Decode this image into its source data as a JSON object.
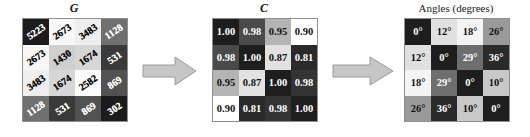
{
  "figure": {
    "background": "#ffffff",
    "arrow_fill": "#c6c6c6",
    "arrow_stroke": "#9a9a9a",
    "grid_border": "#8f8f8f"
  },
  "panels": [
    {
      "id": "g",
      "title": "G",
      "title_style": "italic-bold",
      "matrix": {
        "rows": 4,
        "cols": 4,
        "values": [
          [
            "5223",
            "2673",
            "3483",
            "1128"
          ],
          [
            "2673",
            "1430",
            "1674",
            "531"
          ],
          [
            "3483",
            "1674",
            "2582",
            "869"
          ],
          [
            "1128",
            "531",
            "869",
            "302"
          ]
        ],
        "fills": [
          [
            "#1c1c1c",
            "#f7f7f7",
            "#eeeeee",
            "#707070"
          ],
          [
            "#f7f7f7",
            "#cfcfcf",
            "#d6d6d6",
            "#3a3a3a"
          ],
          [
            "#eeeeee",
            "#d6d6d6",
            "#fbfbfb",
            "#525252"
          ],
          [
            "#707070",
            "#3a3a3a",
            "#525252",
            "#1c1c1c"
          ]
        ],
        "text_colors": [
          [
            "#ffffff",
            "#111111",
            "#111111",
            "#ffffff"
          ],
          [
            "#111111",
            "#111111",
            "#111111",
            "#ffffff"
          ],
          [
            "#111111",
            "#111111",
            "#111111",
            "#ffffff"
          ],
          [
            "#ffffff",
            "#ffffff",
            "#ffffff",
            "#ffffff"
          ]
        ]
      }
    },
    {
      "id": "c",
      "title": "C",
      "title_style": "italic-bold",
      "matrix": {
        "rows": 4,
        "cols": 4,
        "values": [
          [
            "1.00",
            "0.98",
            "0.95",
            "0.90"
          ],
          [
            "0.98",
            "1.00",
            "0.87",
            "0.81"
          ],
          [
            "0.95",
            "0.87",
            "1.00",
            "0.98"
          ],
          [
            "0.90",
            "0.81",
            "0.98",
            "1.00"
          ]
        ],
        "fills": [
          [
            "#1e1e1e",
            "#4a4a4a",
            "#b4b4b4",
            "#ffffff"
          ],
          [
            "#4a4a4a",
            "#1e1e1e",
            "#e2e2e2",
            "#2a2a2a"
          ],
          [
            "#b4b4b4",
            "#e2e2e2",
            "#1e1e1e",
            "#343434"
          ],
          [
            "#ffffff",
            "#2a2a2a",
            "#343434",
            "#1e1e1e"
          ]
        ],
        "text_colors": [
          [
            "#ffffff",
            "#ffffff",
            "#111111",
            "#111111"
          ],
          [
            "#ffffff",
            "#ffffff",
            "#111111",
            "#ffffff"
          ],
          [
            "#111111",
            "#111111",
            "#ffffff",
            "#ffffff"
          ],
          [
            "#111111",
            "#ffffff",
            "#ffffff",
            "#ffffff"
          ]
        ]
      }
    },
    {
      "id": "a",
      "title": "Angles (degrees)",
      "title_style": "plain",
      "matrix": {
        "rows": 4,
        "cols": 4,
        "values": [
          [
            "0°",
            "12°",
            "18°",
            "26°"
          ],
          [
            "12°",
            "0°",
            "29°",
            "36°"
          ],
          [
            "18°",
            "29°",
            "0°",
            "10°"
          ],
          [
            "26°",
            "36°",
            "10°",
            "0°"
          ]
        ],
        "fills": [
          [
            "#1e1e1e",
            "#e0e0e0",
            "#f4f4f4",
            "#9a9a9a"
          ],
          [
            "#e0e0e0",
            "#1e1e1e",
            "#6e6e6e",
            "#2a2a2a"
          ],
          [
            "#f4f4f4",
            "#6e6e6e",
            "#1e1e1e",
            "#c8c8c8"
          ],
          [
            "#9a9a9a",
            "#2a2a2a",
            "#c8c8c8",
            "#1e1e1e"
          ]
        ],
        "text_colors": [
          [
            "#ffffff",
            "#111111",
            "#111111",
            "#111111"
          ],
          [
            "#111111",
            "#ffffff",
            "#ffffff",
            "#ffffff"
          ],
          [
            "#111111",
            "#ffffff",
            "#ffffff",
            "#111111"
          ],
          [
            "#111111",
            "#ffffff",
            "#111111",
            "#ffffff"
          ]
        ]
      }
    }
  ],
  "arrows": [
    {
      "id": "arrow-g-to-c",
      "direction": "right"
    },
    {
      "id": "arrow-c-to-a",
      "direction": "right"
    }
  ],
  "chart_data": {
    "type": "heatmap",
    "title": "",
    "panels": [
      {
        "name": "G",
        "title": "G",
        "type": "heatmap",
        "rows": [
          "r1",
          "r2",
          "r3",
          "r4"
        ],
        "cols": [
          "c1",
          "c2",
          "c3",
          "c4"
        ],
        "values": [
          [
            5223,
            2673,
            3483,
            1128
          ],
          [
            2673,
            1430,
            1674,
            531
          ],
          [
            3483,
            1674,
            2582,
            869
          ],
          [
            1128,
            531,
            869,
            302
          ]
        ],
        "colormap": "grayscale, high value = dark",
        "annotations": "cell numerals drawn rotated approximately -34 degrees"
      },
      {
        "name": "C",
        "title": "C",
        "type": "heatmap",
        "rows": [
          "r1",
          "r2",
          "r3",
          "r4"
        ],
        "cols": [
          "c1",
          "c2",
          "c3",
          "c4"
        ],
        "values": [
          [
            1.0,
            0.98,
            0.95,
            0.9
          ],
          [
            0.98,
            1.0,
            0.87,
            0.81
          ],
          [
            0.95,
            0.87,
            1.0,
            0.98
          ],
          [
            0.9,
            0.81,
            0.98,
            1.0
          ]
        ],
        "colormap": "grayscale, high value = dark"
      },
      {
        "name": "Angles",
        "title": "Angles (degrees)",
        "type": "heatmap",
        "rows": [
          "r1",
          "r2",
          "r3",
          "r4"
        ],
        "cols": [
          "c1",
          "c2",
          "c3",
          "c4"
        ],
        "values": [
          [
            0,
            12,
            18,
            26
          ],
          [
            12,
            0,
            29,
            36
          ],
          [
            18,
            29,
            0,
            10
          ],
          [
            26,
            36,
            10,
            0
          ]
        ],
        "unit": "degrees",
        "colormap": "grayscale, low value = dark"
      }
    ],
    "flow": [
      "G",
      "C",
      "Angles (degrees)"
    ],
    "legend": [],
    "grid": true
  }
}
